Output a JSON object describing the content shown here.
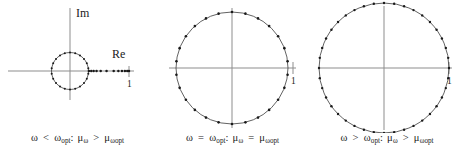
{
  "figure": {
    "axis_color": "#8a8a8a",
    "marker_color": "#1a1a1a",
    "circle_color": "#3a3a3a",
    "background": "#ffffff"
  },
  "panels": [
    {
      "id": "panel-1",
      "name": "omega-less-than-optimal",
      "axis_labels": {
        "imaginary": "Im",
        "real": "Re"
      },
      "unit_tick_label": "1",
      "caption": {
        "omega": "ω",
        "relation_left": "<",
        "omega_opt": "ω",
        "omega_opt_sub": "opt",
        "separator": ":",
        "mu_omega": "μ",
        "mu_omega_sub": "ω",
        "relation_right": ">",
        "mu_omega_opt": "μ",
        "mu_omega_opt_sub": "ωopt"
      },
      "spectrum": {
        "circle_points": 22,
        "circle_radius_fraction": 0.3,
        "real_axis_points": [
          0.32,
          0.36,
          0.4,
          0.45,
          0.52,
          0.62,
          0.74,
          0.82,
          0.88,
          0.93,
          0.97,
          1.0
        ],
        "description": "small complex circle plus real eigenvalues spread out to 1"
      }
    },
    {
      "id": "panel-2",
      "name": "omega-equal-optimal",
      "axis_labels": {
        "imaginary": "",
        "real": ""
      },
      "unit_tick_label": "1",
      "caption": {
        "omega": "ω",
        "relation_left": "=",
        "omega_opt": "ω",
        "omega_opt_sub": "opt",
        "separator": ":",
        "mu_omega": "μ",
        "mu_omega_sub": "ω",
        "relation_right": "=",
        "mu_omega_opt": "μ",
        "mu_omega_opt_sub": "ωopt"
      },
      "spectrum": {
        "circle_points": 26,
        "circle_radius_fraction": 0.92,
        "real_axis_points": [],
        "description": "all eigenvalues on one circle of radius mu_omega_opt"
      }
    },
    {
      "id": "panel-3",
      "name": "omega-greater-than-optimal",
      "axis_labels": {
        "imaginary": "",
        "real": ""
      },
      "unit_tick_label": "1",
      "caption": {
        "omega": "ω",
        "relation_left": ">",
        "omega_opt": "ω",
        "omega_opt_sub": "opt",
        "separator": ":",
        "mu_omega": "μ",
        "mu_omega_sub": "ω",
        "relation_right": ">",
        "mu_omega_opt": "μ",
        "mu_omega_opt_sub": "ωopt"
      },
      "spectrum": {
        "circle_points": 40,
        "circle_radius_fraction": 1.0,
        "real_axis_points": [],
        "description": "all eigenvalues on a larger circle, densely packed"
      }
    }
  ],
  "chart_data": {
    "type": "scatter",
    "xlabel": "Re",
    "ylabel": "Im",
    "series": [
      {
        "name": "omega < omega_opt",
        "panel": 1,
        "circle_radius": 0.3,
        "circle_point_count": 22,
        "real_values": [
          0.32,
          0.36,
          0.4,
          0.45,
          0.52,
          0.62,
          0.74,
          0.82,
          0.88,
          0.93,
          0.97,
          1.0
        ],
        "annotation": "mu_omega > mu_omega_opt"
      },
      {
        "name": "omega = omega_opt",
        "panel": 2,
        "circle_radius": 0.92,
        "circle_point_count": 26,
        "real_values": [],
        "annotation": "mu_omega = mu_omega_opt"
      },
      {
        "name": "omega > omega_opt",
        "panel": 3,
        "circle_radius": 1.0,
        "circle_point_count": 40,
        "real_values": [],
        "annotation": "mu_omega > mu_omega_opt"
      }
    ],
    "xlim": [
      -1.15,
      1.15
    ],
    "ylim": [
      -1.15,
      1.15
    ],
    "grid": false,
    "legend": "none"
  }
}
